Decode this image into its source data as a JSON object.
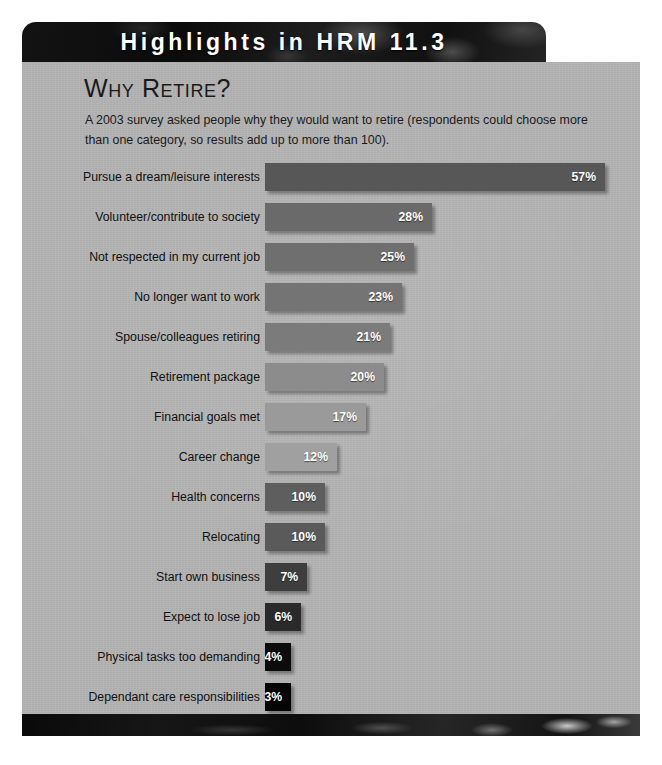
{
  "header": {
    "title": "Highlights in HRM 11.3"
  },
  "panel": {
    "title": "Why Retire?",
    "subtitle": "A 2003 survey asked people why they would want to retire (respondents could choose more than one category, so results add up to more than 100)."
  },
  "footer": {
    "label": "decorative-footer-strip"
  },
  "chart_data": {
    "type": "bar",
    "orientation": "horizontal",
    "title": "Why Retire?",
    "subtitle": "A 2003 survey asked people why they would want to retire (respondents could choose more than one category, so results add up to more than 100).",
    "xlabel": "",
    "ylabel": "",
    "xlim": [
      0,
      57
    ],
    "grid": false,
    "legend": "none",
    "value_suffix": "%",
    "categories": [
      "Pursue a dream/leisure interests",
      "Volunteer/contribute to society",
      "Not respected in my current job",
      "No longer want to work",
      "Spouse/colleagues retiring",
      "Retirement package",
      "Financial goals met",
      "Career change",
      "Health concerns",
      "Relocating",
      "Start own business",
      "Expect to lose job",
      "Physical tasks too demanding",
      "Dependant care responsibilities"
    ],
    "values": [
      57,
      28,
      25,
      23,
      21,
      20,
      17,
      12,
      10,
      10,
      7,
      6,
      4,
      3
    ],
    "labels": [
      "57%",
      "28%",
      "25%",
      "23%",
      "21%",
      "20%",
      "17%",
      "12%",
      "10%",
      "10%",
      "7%",
      "6%",
      "4%",
      "3%"
    ],
    "bar_colors": [
      "#575757",
      "#6a6a6a",
      "#6f6f6f",
      "#747474",
      "#7b7b7b",
      "#8c8c8c",
      "#9a9a9a",
      "#a0a0a0",
      "#5e5e5e",
      "#5a5a5a",
      "#3e3e3e",
      "#2a2a2a",
      "#0c0c0c",
      "#050505"
    ]
  }
}
